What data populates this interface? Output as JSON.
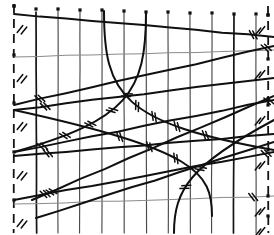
{
  "figure": {
    "title": "Barbed wire fence lattice diagram",
    "caption": "",
    "style": "hand-drawn ink line illustration",
    "width_px": 274,
    "height_px": 235,
    "background_color": "#ffffff",
    "ink_color": "#101010",
    "faint_ink_color": "#8a8a8a"
  },
  "chart_data": {
    "type": "line",
    "title": "Barbed wire fence lattice diagram",
    "xlabel": "",
    "ylabel": "",
    "xlim": [
      0,
      274
    ],
    "ylim": [
      0,
      235
    ],
    "grid": true,
    "legend": "none",
    "posts": [
      {
        "name": "post-0-dashed",
        "x": 14,
        "y_top": 4,
        "y_bottom": 233,
        "style": "dashed",
        "weight": "heavy"
      },
      {
        "name": "post-1",
        "x": 36,
        "y_top": 12,
        "y_bottom": 233,
        "style": "solid",
        "weight": "heavy"
      },
      {
        "name": "post-2",
        "x": 58,
        "y_top": 10,
        "y_bottom": 233,
        "style": "solid",
        "weight": "thin"
      },
      {
        "name": "post-3",
        "x": 80,
        "y_top": 11,
        "y_bottom": 233,
        "style": "solid",
        "weight": "thin"
      },
      {
        "name": "post-4",
        "x": 102,
        "y_top": 11,
        "y_bottom": 233,
        "style": "solid",
        "weight": "thin"
      },
      {
        "name": "post-5",
        "x": 124,
        "y_top": 12,
        "y_bottom": 233,
        "style": "solid",
        "weight": "thin"
      },
      {
        "name": "post-6",
        "x": 146,
        "y_top": 13,
        "y_bottom": 233,
        "style": "solid",
        "weight": "thin"
      },
      {
        "name": "post-7",
        "x": 168,
        "y_top": 13,
        "y_bottom": 233,
        "style": "solid",
        "weight": "thin"
      },
      {
        "name": "post-8",
        "x": 190,
        "y_top": 14,
        "y_bottom": 233,
        "style": "solid",
        "weight": "thin"
      },
      {
        "name": "post-9",
        "x": 212,
        "y_top": 15,
        "y_bottom": 233,
        "style": "solid",
        "weight": "thin"
      },
      {
        "name": "post-10",
        "x": 234,
        "y_top": 15,
        "y_bottom": 233,
        "style": "solid",
        "weight": "heavy"
      },
      {
        "name": "post-11",
        "x": 256,
        "y_top": 16,
        "y_bottom": 233,
        "style": "solid",
        "weight": "thin"
      },
      {
        "name": "post-12-dashed",
        "x": 268,
        "y_top": 6,
        "y_bottom": 233,
        "style": "dashed",
        "weight": "heavy"
      }
    ],
    "top_nodes": [
      {
        "x": 14,
        "y": 6
      },
      {
        "x": 36,
        "y": 9
      },
      {
        "x": 58,
        "y": 9
      },
      {
        "x": 80,
        "y": 10
      },
      {
        "x": 102,
        "y": 10
      },
      {
        "x": 124,
        "y": 11
      },
      {
        "x": 146,
        "y": 12
      },
      {
        "x": 168,
        "y": 12
      },
      {
        "x": 190,
        "y": 13
      },
      {
        "x": 212,
        "y": 13
      },
      {
        "x": 234,
        "y": 14
      },
      {
        "x": 256,
        "y": 14
      },
      {
        "x": 268,
        "y": 15
      }
    ],
    "left_nodes": [
      {
        "x": 14,
        "y": 6
      },
      {
        "x": 14,
        "y": 55
      },
      {
        "x": 14,
        "y": 103
      },
      {
        "x": 14,
        "y": 152
      },
      {
        "x": 14,
        "y": 200
      }
    ],
    "right_nodes": [
      {
        "x": 268,
        "y": 15
      },
      {
        "x": 268,
        "y": 59
      },
      {
        "x": 268,
        "y": 105
      },
      {
        "x": 268,
        "y": 150
      },
      {
        "x": 268,
        "y": 196
      },
      {
        "x": 268,
        "y": 216
      }
    ],
    "strands": [
      {
        "name": "strand-top",
        "kind": "straight",
        "weight": "heavy",
        "points": [
          [
            14,
            14
          ],
          [
            274,
            37
          ]
        ],
        "barbs": [
          0.92
        ]
      },
      {
        "name": "strand-2-faint",
        "kind": "straight",
        "weight": "faint",
        "points": [
          [
            14,
            57
          ],
          [
            274,
            50
          ]
        ],
        "barbs": []
      },
      {
        "name": "strand-3",
        "kind": "straight",
        "weight": "heavy",
        "points": [
          [
            14,
            105
          ],
          [
            274,
            46
          ]
        ],
        "barbs": [
          0.1,
          0.97
        ]
      },
      {
        "name": "strand-4",
        "kind": "straight",
        "weight": "heavy",
        "points": [
          [
            14,
            110
          ],
          [
            274,
            78
          ]
        ],
        "barbs": [
          0.12
        ]
      },
      {
        "name": "strand-5",
        "kind": "straight",
        "weight": "heavy",
        "points": [
          [
            14,
            152
          ],
          [
            274,
            100
          ]
        ],
        "barbs": [
          0.11,
          0.98
        ]
      },
      {
        "name": "strand-6",
        "kind": "straight",
        "weight": "heavy",
        "points": [
          [
            14,
            156
          ],
          [
            274,
            134
          ]
        ],
        "barbs": [
          0.13
        ]
      },
      {
        "name": "strand-7",
        "kind": "straight",
        "weight": "heavy",
        "points": [
          [
            14,
            200
          ],
          [
            274,
            152
          ]
        ],
        "barbs": [
          0.12,
          0.97
        ]
      },
      {
        "name": "strand-8-faint",
        "kind": "straight",
        "weight": "faint",
        "points": [
          [
            14,
            204
          ],
          [
            274,
            196
          ]
        ],
        "barbs": [
          0.92
        ]
      },
      {
        "name": "strand-diag-up-1",
        "kind": "straight",
        "weight": "heavy",
        "points": [
          [
            32,
            200
          ],
          [
            274,
            96
          ]
        ],
        "barbs": [
          0.08
        ]
      },
      {
        "name": "strand-diag-up-2",
        "kind": "straight",
        "weight": "heavy",
        "points": [
          [
            36,
            218
          ],
          [
            274,
            142
          ]
        ],
        "barbs": []
      },
      {
        "name": "wire-curve-a",
        "kind": "curve",
        "weight": "heavy",
        "points": [
          [
            104,
            11
          ],
          [
            104,
            95
          ],
          [
            122,
            123
          ],
          [
            274,
            150
          ]
        ],
        "barbs": [
          0.42,
          0.5,
          0.6,
          0.72
        ]
      },
      {
        "name": "wire-curve-b",
        "kind": "curve",
        "weight": "heavy",
        "points": [
          [
            146,
            13
          ],
          [
            146,
            92
          ],
          [
            128,
            120
          ],
          [
            14,
            152
          ]
        ],
        "barbs": [
          0.4,
          0.5,
          0.62,
          0.75
        ]
      },
      {
        "name": "wire-curve-c",
        "kind": "curve",
        "weight": "heavy",
        "points": [
          [
            212,
            216
          ],
          [
            212,
            172
          ],
          [
            196,
            150
          ],
          [
            14,
            110
          ]
        ],
        "barbs": [
          0.3,
          0.42,
          0.55
        ]
      },
      {
        "name": "wire-curve-d",
        "kind": "curve",
        "weight": "heavy",
        "points": [
          [
            174,
            233
          ],
          [
            174,
            190
          ],
          [
            190,
            165
          ],
          [
            274,
            120
          ]
        ],
        "barbs": [
          0.3,
          0.45
        ]
      }
    ],
    "crossings": [
      {
        "name": "center-x-upper",
        "x": 135,
        "y": 118
      },
      {
        "name": "center-x-lower",
        "x": 150,
        "y": 152
      }
    ],
    "barb_style": {
      "shape": "double-tick",
      "length_px": 9,
      "angle_deg": 55,
      "count_per_cluster": 2
    }
  }
}
